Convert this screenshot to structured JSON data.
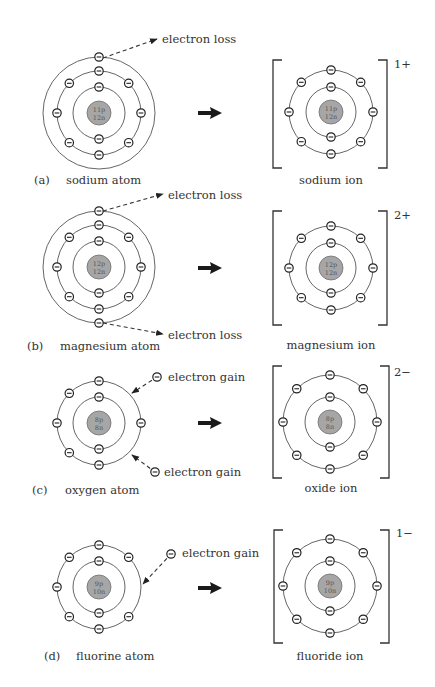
{
  "colors": {
    "nucleus_fill": "#a6a6a6",
    "ring_stroke": "#555555",
    "text": "#333333",
    "background": "#ffffff"
  },
  "electron_symbol": "minus-in-circle",
  "panels": [
    {
      "id": "a",
      "tag": "(a)",
      "atom": {
        "label": "sodium atom",
        "nucleus": {
          "protons": "11p",
          "neutrons": "12n"
        },
        "center": [
          99,
          113
        ],
        "shells": [
          2,
          8,
          1
        ],
        "radii": [
          26,
          42,
          56
        ]
      },
      "ion": {
        "label": "sodium ion",
        "charge": "1+",
        "nucleus": {
          "protons": "11p",
          "neutrons": "12n"
        },
        "center": [
          331,
          112
        ],
        "shells": [
          2,
          8
        ],
        "radii": [
          25,
          42
        ]
      },
      "transfers": [
        {
          "type": "loss",
          "label": "electron loss",
          "from": [
            99,
            58
          ],
          "to": [
            157,
            39
          ],
          "label_pos": [
            162,
            43
          ]
        }
      ]
    },
    {
      "id": "b",
      "tag": "(b)",
      "atom": {
        "label": "magnesium atom",
        "nucleus": {
          "protons": "12p",
          "neutrons": "12n"
        },
        "center": [
          99,
          267
        ],
        "shells": [
          2,
          8,
          2
        ],
        "radii": [
          26,
          42,
          56
        ]
      },
      "ion": {
        "label": "magnesium ion",
        "charge": "2+",
        "nucleus": {
          "protons": "12p",
          "neutrons": "12n"
        },
        "center": [
          331,
          268
        ],
        "shells": [
          2,
          8
        ],
        "radii": [
          25,
          42
        ]
      },
      "transfers": [
        {
          "type": "loss",
          "label": "electron loss",
          "from": [
            99,
            211
          ],
          "to": [
            163,
            194
          ],
          "label_pos": [
            168,
            199
          ]
        },
        {
          "type": "loss",
          "label": "electron loss",
          "from": [
            99,
            323
          ],
          "to": [
            163,
            334
          ],
          "label_pos": [
            168,
            339
          ]
        }
      ]
    },
    {
      "id": "c",
      "tag": "(c)",
      "atom": {
        "label": "oxygen atom",
        "nucleus": {
          "protons": "8p",
          "neutrons": "8n"
        },
        "center": [
          99,
          423
        ],
        "shells": [
          2,
          6
        ],
        "radii": [
          26,
          42
        ]
      },
      "ion": {
        "label": "oxide ion",
        "charge": "2−",
        "nucleus": {
          "protons": "8p",
          "neutrons": "8n"
        },
        "center": [
          330,
          422
        ],
        "shells": [
          2,
          8
        ],
        "radii": [
          25,
          47
        ]
      },
      "transfers": [
        {
          "type": "gain",
          "label": "electron gain",
          "from": [
            157,
            377
          ],
          "to": [
            132,
            393
          ],
          "label_pos": [
            168,
            381
          ]
        },
        {
          "type": "gain",
          "label": "electron gain",
          "from": [
            155,
            472
          ],
          "to": [
            132,
            455
          ],
          "label_pos": [
            164,
            476
          ]
        }
      ]
    },
    {
      "id": "d",
      "tag": "(d)",
      "atom": {
        "label": "fluorine atom",
        "nucleus": {
          "protons": "9p",
          "neutrons": "10n"
        },
        "center": [
          99,
          587
        ],
        "shells": [
          2,
          7
        ],
        "radii": [
          26,
          42
        ]
      },
      "ion": {
        "label": "fluoride ion",
        "charge": "1−",
        "nucleus": {
          "protons": "9p",
          "neutrons": "10n"
        },
        "center": [
          330,
          586
        ],
        "shells": [
          2,
          8
        ],
        "radii": [
          25,
          47
        ]
      },
      "transfers": [
        {
          "type": "gain",
          "label": "electron gain",
          "from": [
            171,
            554
          ],
          "to": [
            143,
            584
          ],
          "label_pos": [
            182,
            557
          ]
        }
      ]
    }
  ],
  "layout": {
    "arrows_y": [
      113,
      268,
      423,
      588
    ],
    "brackets": [
      {
        "left": 273,
        "right": 387,
        "top": 60,
        "bottom": 168,
        "charge_pos": [
          394,
          68
        ]
      },
      {
        "left": 273,
        "right": 387,
        "top": 211,
        "bottom": 325,
        "charge_pos": [
          394,
          219
        ]
      },
      {
        "left": 273,
        "right": 389,
        "top": 366,
        "bottom": 478,
        "charge_pos": [
          394,
          376
        ]
      },
      {
        "left": 274,
        "right": 389,
        "top": 530,
        "bottom": 643,
        "charge_pos": [
          396,
          537
        ]
      }
    ],
    "atom_labels": [
      {
        "tag_pos": [
          34,
          184
        ],
        "label_pos": [
          66,
          184
        ]
      },
      {
        "tag_pos": [
          27,
          350
        ],
        "label_pos": [
          60,
          350
        ]
      },
      {
        "tag_pos": [
          32,
          494
        ],
        "label_pos": [
          65,
          494
        ]
      },
      {
        "tag_pos": [
          44,
          660
        ],
        "label_pos": [
          76,
          660
        ]
      }
    ],
    "ion_labels_pos": [
      [
        331,
        184
      ],
      [
        331,
        349
      ],
      [
        331,
        492
      ],
      [
        330,
        660
      ]
    ]
  }
}
